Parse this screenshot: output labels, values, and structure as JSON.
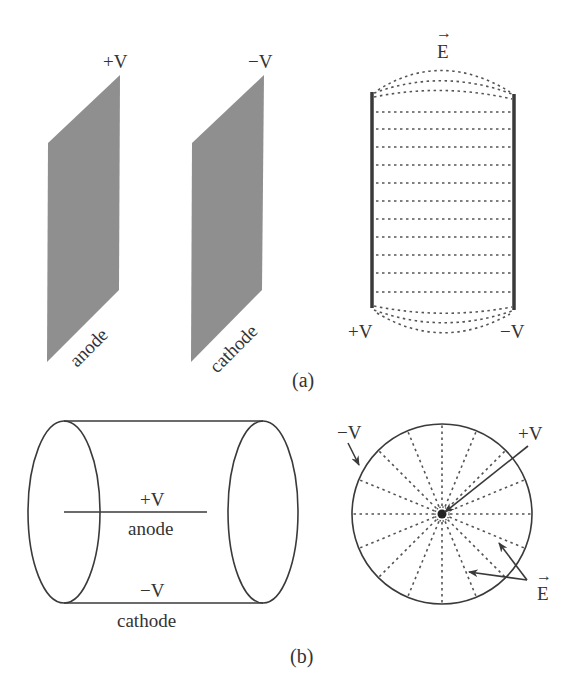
{
  "colors": {
    "plate_fill": "#8f8f8f",
    "line": "#3a3a3a",
    "dash": "#555555",
    "text": "#333333",
    "background": "#ffffff"
  },
  "part_a": {
    "caption": "(a)",
    "plates": [
      {
        "name": "anode",
        "label": "anode",
        "voltage": "+V"
      },
      {
        "name": "cathode",
        "label": "cathode",
        "voltage": "−V"
      }
    ],
    "field_view": {
      "field_label": "E",
      "field_vector_arrow": "→",
      "left_plate_voltage": "+V",
      "right_plate_voltage": "−V",
      "straight_field_lines": 11,
      "fringing_lines_top": 3,
      "fringing_lines_bottom": 3
    }
  },
  "part_b": {
    "caption": "(b)",
    "cylinder": {
      "anode_voltage": "+V",
      "anode_label": "anode",
      "cathode_voltage": "−V",
      "cathode_label": "cathode"
    },
    "cross_section": {
      "outer_voltage": "−V",
      "center_voltage": "+V",
      "field_label": "E",
      "field_vector_arrow": "→",
      "radial_field_lines": 16
    }
  }
}
